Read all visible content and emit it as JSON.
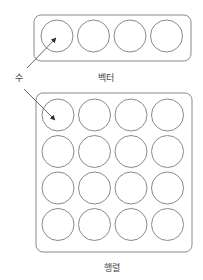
{
  "labels": {
    "number": "수",
    "vector": "벡터",
    "matrix": "행렬"
  },
  "vector": {
    "box": {
      "x": 34,
      "y": 15,
      "w": 157,
      "h": 46,
      "r": 7
    },
    "circles": {
      "rows": 1,
      "cols": 4,
      "x0": 57,
      "y0": 36,
      "dx": 36.5,
      "dy": 0,
      "r": 16
    }
  },
  "matrix": {
    "box": {
      "x": 36,
      "y": 93,
      "w": 156,
      "h": 159,
      "r": 7
    },
    "circles": {
      "rows": 4,
      "cols": 4,
      "x0": 58,
      "y0": 115,
      "dx": 36.5,
      "dy": 36.5,
      "r": 16
    }
  },
  "arrows": [
    {
      "from": [
        27,
        68
      ],
      "to": [
        56,
        38
      ]
    },
    {
      "from": [
        24,
        89
      ],
      "to": [
        55,
        120
      ]
    }
  ],
  "colors": {
    "stroke": "#8a8a8a",
    "arrow": "#555555",
    "text": "#444444"
  }
}
